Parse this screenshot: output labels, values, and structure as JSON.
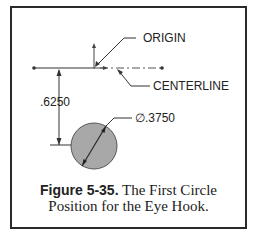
{
  "figure": {
    "labels": {
      "origin": "ORIGIN",
      "centerline": "CENTERLINE",
      "vertical_dim": ".6250",
      "diameter_dim": "∅.3750"
    },
    "caption": {
      "number": "Figure 5-35.",
      "line1_text": " The First Circle",
      "line2_text": "Position for the Eye Hook."
    },
    "colors": {
      "circle_fill": "#a8a8a8",
      "line": "#333333",
      "border": "#2a2a2a"
    }
  }
}
